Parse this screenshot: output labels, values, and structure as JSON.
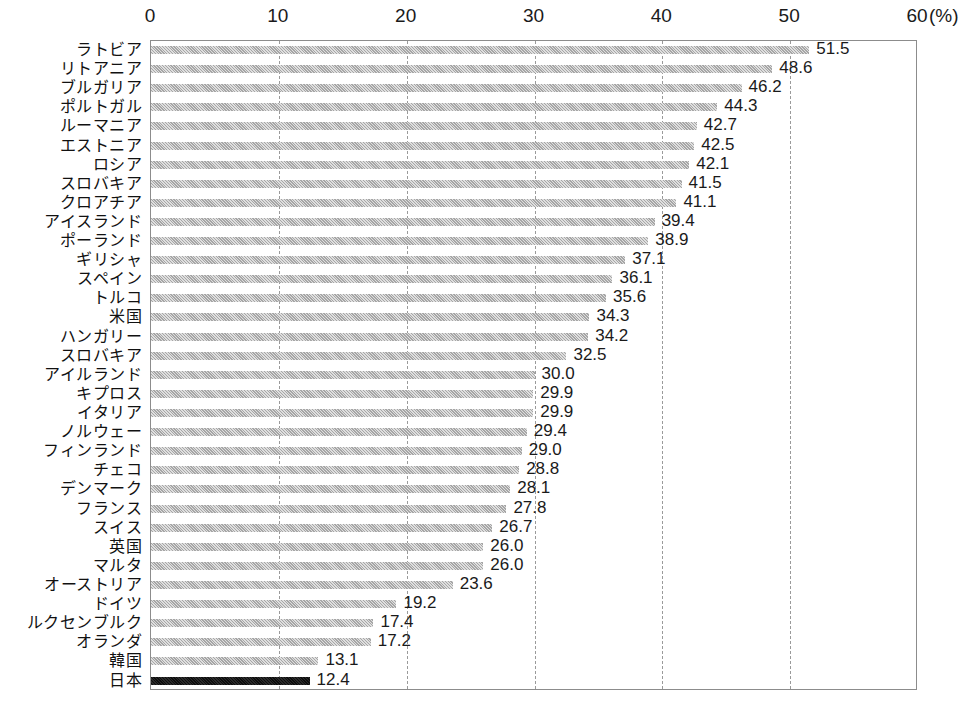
{
  "chart_data": {
    "type": "bar",
    "orientation": "horizontal",
    "title": "",
    "subtitle": "",
    "xlabel": "(%)",
    "ylabel": "",
    "unit_label": "(%)",
    "xlim": [
      0,
      60
    ],
    "xticks": [
      0,
      10,
      20,
      30,
      40,
      50,
      60
    ],
    "xtick_labels": [
      "0",
      "10",
      "20",
      "30",
      "40",
      "50",
      "60"
    ],
    "grid": true,
    "grid_axis": "x",
    "grid_style": "dashed",
    "legend": false,
    "legend_position": "none",
    "highlight_category": "日本",
    "bar_color": "#b9b9b9",
    "highlight_color": "#121212",
    "categories": [
      "ラトビア",
      "リトアニア",
      "ブルガリア",
      "ポルトガル",
      "ルーマニア",
      "エストニア",
      "ロシア",
      "スロバキア",
      "クロアチア",
      "アイスランド",
      "ポーランド",
      "ギリシャ",
      "スペイン",
      "トルコ",
      "米国",
      "ハンガリー",
      "スロバキア",
      "アイルランド",
      "キプロス",
      "イタリア",
      "ノルウェー",
      "フィンランド",
      "チェコ",
      "デンマーク",
      "フランス",
      "スイス",
      "英国",
      "マルタ",
      "オーストリア",
      "ドイツ",
      "ルクセンブルク",
      "オランダ",
      "韓国",
      "日本"
    ],
    "values": [
      51.5,
      48.6,
      46.2,
      44.3,
      42.7,
      42.5,
      42.1,
      41.5,
      41.1,
      39.4,
      38.9,
      37.1,
      36.1,
      35.6,
      34.3,
      34.2,
      32.5,
      30.0,
      29.9,
      29.9,
      29.4,
      29.0,
      28.8,
      28.1,
      27.8,
      26.7,
      26.0,
      26.0,
      23.6,
      19.2,
      17.4,
      17.2,
      13.1,
      12.4
    ],
    "value_labels": [
      "51.5",
      "48.6",
      "46.2",
      "44.3",
      "42.7",
      "42.5",
      "42.1",
      "41.5",
      "41.1",
      "39.4",
      "38.9",
      "37.1",
      "36.1",
      "35.6",
      "34.3",
      "34.2",
      "32.5",
      "30.0",
      "29.9",
      "29.9",
      "29.4",
      "29.0",
      "28.8",
      "28.1",
      "27.8",
      "26.7",
      "26.0",
      "26.0",
      "23.6",
      "19.2",
      "17.4",
      "17.2",
      "13.1",
      "12.4"
    ]
  }
}
